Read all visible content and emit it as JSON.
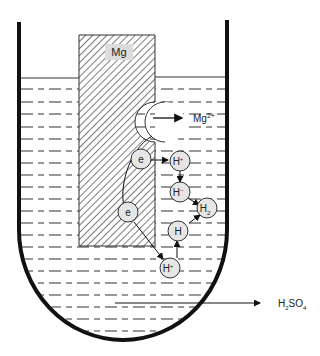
{
  "diagram": {
    "electrode_label": "Mg",
    "ion_out": {
      "label": "Mg",
      "charge": "2+"
    },
    "electrons": [
      {
        "label": "e"
      },
      {
        "label": "e"
      }
    ],
    "particles": [
      {
        "id": "h-plus-1",
        "label": "H",
        "sup": "+"
      },
      {
        "id": "h-minus",
        "label": "H",
        "sup": "–"
      },
      {
        "id": "h2",
        "label": "H",
        "sub": "2"
      },
      {
        "id": "h-atom",
        "label": "H",
        "sup": ""
      },
      {
        "id": "h-plus-2",
        "label": "H",
        "sup": "+"
      }
    ],
    "solution_label": {
      "p1": "H",
      "s1": "2",
      "p2": "SO",
      "s2": "4"
    },
    "colors": {
      "line": "#111111",
      "particle_fill": "#e6e6e6",
      "label_bg": "#dddddd"
    }
  }
}
